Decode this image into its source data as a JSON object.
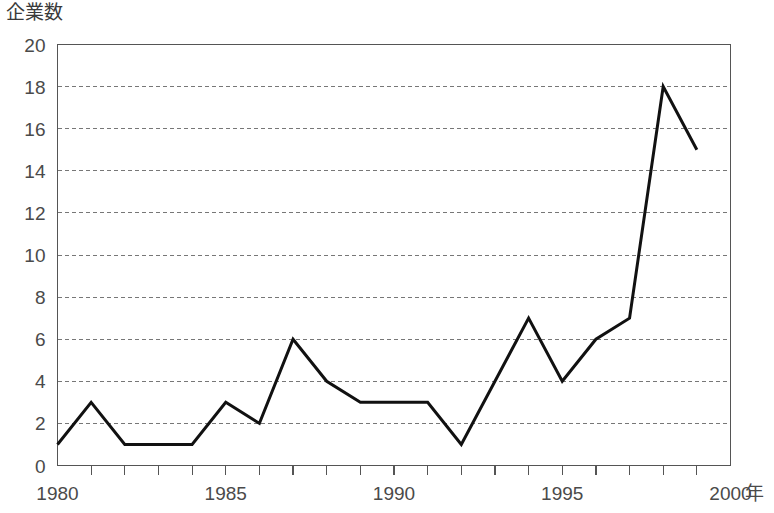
{
  "chart_data": {
    "type": "line",
    "title": "企業数",
    "xlabel": "年",
    "ylabel": "企業数",
    "x": [
      1980,
      1981,
      1982,
      1983,
      1984,
      1985,
      1986,
      1987,
      1988,
      1989,
      1990,
      1991,
      1992,
      1993,
      1994,
      1995,
      1996,
      1997,
      1998,
      1999
    ],
    "values": [
      1,
      3,
      1,
      1,
      1,
      3,
      2,
      6,
      4,
      3,
      3,
      3,
      1,
      4,
      7,
      4,
      6,
      7,
      18,
      15
    ],
    "series": [
      {
        "name": "企業数",
        "values": [
          1,
          3,
          1,
          1,
          1,
          3,
          2,
          6,
          4,
          3,
          3,
          3,
          1,
          4,
          7,
          4,
          6,
          7,
          18,
          15
        ]
      }
    ],
    "xlim": [
      1980,
      2000
    ],
    "ylim": [
      0,
      20
    ],
    "ytick_step": 2,
    "yticks": [
      0,
      2,
      4,
      6,
      8,
      10,
      12,
      14,
      16,
      18,
      20
    ],
    "ytick_labels": [
      "0",
      "2",
      "4",
      "6",
      "8",
      "10",
      "12",
      "14",
      "16",
      "18",
      "20"
    ],
    "xticks": [
      1980,
      1981,
      1982,
      1983,
      1984,
      1985,
      1986,
      1987,
      1988,
      1989,
      1990,
      1991,
      1992,
      1993,
      1994,
      1995,
      1996,
      1997,
      1998,
      1999,
      2000
    ],
    "xtick_labels_shown": [
      {
        "value": 1980,
        "label": "1980"
      },
      {
        "value": 1985,
        "label": "1985"
      },
      {
        "value": 1990,
        "label": "1990"
      },
      {
        "value": 1995,
        "label": "1995"
      },
      {
        "value": 2000,
        "label": "2000"
      }
    ],
    "xtick_interval": 1,
    "grid": {
      "horizontal": true,
      "vertical": false,
      "style": "dashed"
    },
    "legend": {
      "visible": false,
      "position": "none"
    },
    "colors": {
      "line": "#111111",
      "grid": "#777777",
      "axis": "#555555",
      "text": "#4a4a4a",
      "background": "#ffffff"
    }
  }
}
